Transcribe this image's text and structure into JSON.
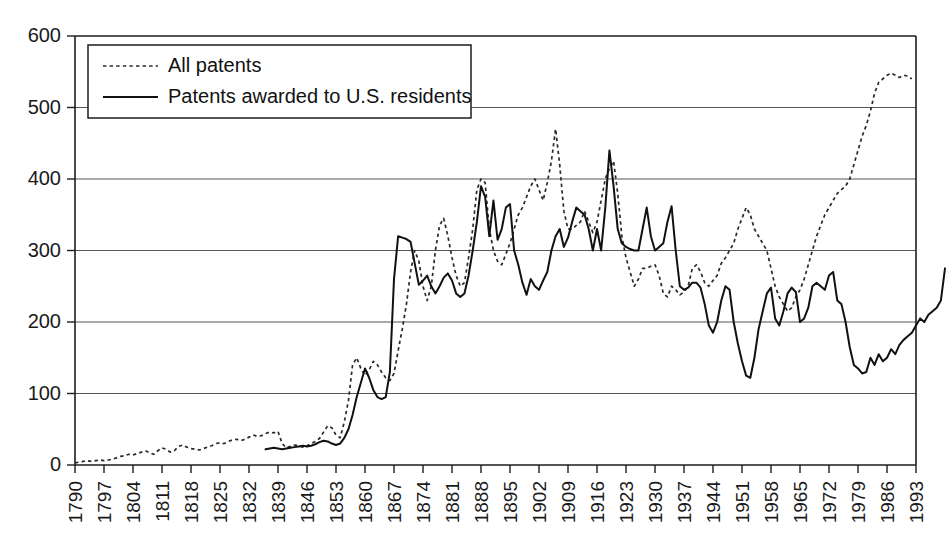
{
  "chart_data": {
    "type": "line",
    "title": "",
    "subtitle": "",
    "xlabel": "",
    "ylabel": "",
    "xlim": [
      1790,
      1993
    ],
    "ylim": [
      0,
      600
    ],
    "grid": true,
    "grid_axis": "y",
    "legend_position": "top-left",
    "y_ticks": [
      0,
      100,
      200,
      300,
      400,
      500,
      600
    ],
    "y_tick_labels": [
      "0",
      "100",
      "200",
      "300",
      "400",
      "500",
      "600"
    ],
    "x_ticks": [
      1790,
      1797,
      1804,
      1811,
      1818,
      1825,
      1832,
      1839,
      1846,
      1853,
      1860,
      1867,
      1874,
      1881,
      1888,
      1895,
      1902,
      1909,
      1916,
      1923,
      1930,
      1937,
      1944,
      1951,
      1958,
      1965,
      1972,
      1979,
      1986,
      1993
    ],
    "x_tick_labels": [
      "1790",
      "1797",
      "1804",
      "1811",
      "1818",
      "1825",
      "1832",
      "1839",
      "1846",
      "1853",
      "1860",
      "1867",
      "1874",
      "1881",
      "1888",
      "1895",
      "1902",
      "1909",
      "1916",
      "1923",
      "1930",
      "1937",
      "1944",
      "1951",
      "1958",
      "1965",
      "1972",
      "1979",
      "1986",
      "1993"
    ],
    "legend": [
      {
        "label": "All patents",
        "style": "dashed",
        "color": "#2a2a2a"
      },
      {
        "label": "Patents awarded to U.S. residents",
        "style": "solid",
        "color": "#111111"
      }
    ],
    "series": [
      {
        "name": "All patents",
        "style": "dashed",
        "color": "#2a2a2a",
        "x_start": 1790,
        "values": [
          3,
          4,
          5,
          6,
          5,
          6,
          7,
          6,
          7,
          8,
          10,
          12,
          13,
          15,
          14,
          16,
          18,
          20,
          17,
          15,
          20,
          24,
          22,
          18,
          20,
          26,
          28,
          25,
          23,
          22,
          21,
          23,
          25,
          27,
          30,
          31,
          30,
          33,
          35,
          36,
          34,
          36,
          39,
          42,
          40,
          41,
          44,
          46,
          45,
          47,
          30,
          24,
          26,
          28,
          27,
          25,
          27,
          30,
          33,
          37,
          46,
          55,
          52,
          42,
          38,
          60,
          90,
          140,
          150,
          135,
          125,
          133,
          145,
          140,
          130,
          122,
          118,
          128,
          160,
          190,
          225,
          270,
          300,
          285,
          250,
          230,
          250,
          300,
          335,
          345,
          320,
          290,
          265,
          250,
          255,
          290,
          330,
          385,
          400,
          395,
          330,
          300,
          285,
          280,
          295,
          310,
          330,
          350,
          360,
          375,
          390,
          400,
          385,
          370,
          395,
          425,
          470,
          420,
          355,
          330,
          330,
          335,
          340,
          355,
          340,
          325,
          340,
          370,
          400,
          415,
          425,
          380,
          320,
          290,
          270,
          250,
          260,
          275,
          275,
          278,
          280,
          265,
          240,
          235,
          250,
          245,
          238,
          242,
          250,
          275,
          280,
          270,
          255,
          250,
          258,
          265,
          282,
          290,
          300,
          310,
          330,
          345,
          360,
          350,
          330,
          320,
          310,
          300,
          275,
          250,
          235,
          225,
          215,
          220,
          235,
          245,
          260,
          280,
          300,
          320,
          335,
          350,
          360,
          370,
          380,
          385,
          390,
          400,
          420,
          440,
          460,
          475,
          495,
          520,
          535,
          540,
          545,
          548,
          545,
          542,
          545,
          544,
          540
        ]
      },
      {
        "name": "Patents awarded to U.S. residents",
        "style": "solid",
        "color": "#111111",
        "x_start": 1836,
        "values": [
          22,
          23,
          24,
          23,
          22,
          23,
          24,
          25,
          26,
          27,
          26,
          27,
          29,
          32,
          34,
          33,
          30,
          28,
          30,
          38,
          50,
          70,
          95,
          115,
          135,
          122,
          105,
          95,
          92,
          95,
          130,
          260,
          320,
          318,
          316,
          312,
          282,
          252,
          258,
          265,
          250,
          240,
          250,
          262,
          268,
          258,
          240,
          235,
          240,
          265,
          300,
          340,
          390,
          375,
          320,
          370,
          315,
          330,
          360,
          365,
          300,
          280,
          255,
          238,
          260,
          250,
          245,
          258,
          270,
          300,
          320,
          330,
          305,
          318,
          340,
          360,
          355,
          350,
          330,
          300,
          330,
          300,
          360,
          440,
          390,
          330,
          310,
          305,
          302,
          300,
          300,
          330,
          360,
          320,
          300,
          305,
          310,
          340,
          362,
          300,
          250,
          245,
          248,
          255,
          255,
          248,
          225,
          195,
          185,
          200,
          230,
          250,
          245,
          200,
          170,
          145,
          125,
          122,
          150,
          190,
          215,
          240,
          248,
          205,
          195,
          215,
          240,
          248,
          242,
          200,
          205,
          220,
          250,
          255,
          250,
          245,
          265,
          270,
          230,
          225,
          200,
          165,
          140,
          135,
          128,
          130,
          150,
          140,
          155,
          145,
          150,
          162,
          155,
          168,
          175,
          180,
          185,
          195,
          205,
          200,
          210,
          215,
          220,
          230,
          275
        ]
      }
    ]
  },
  "legend": {
    "item_1_label": "All patents",
    "item_2_label": "Patents awarded to U.S. residents"
  }
}
